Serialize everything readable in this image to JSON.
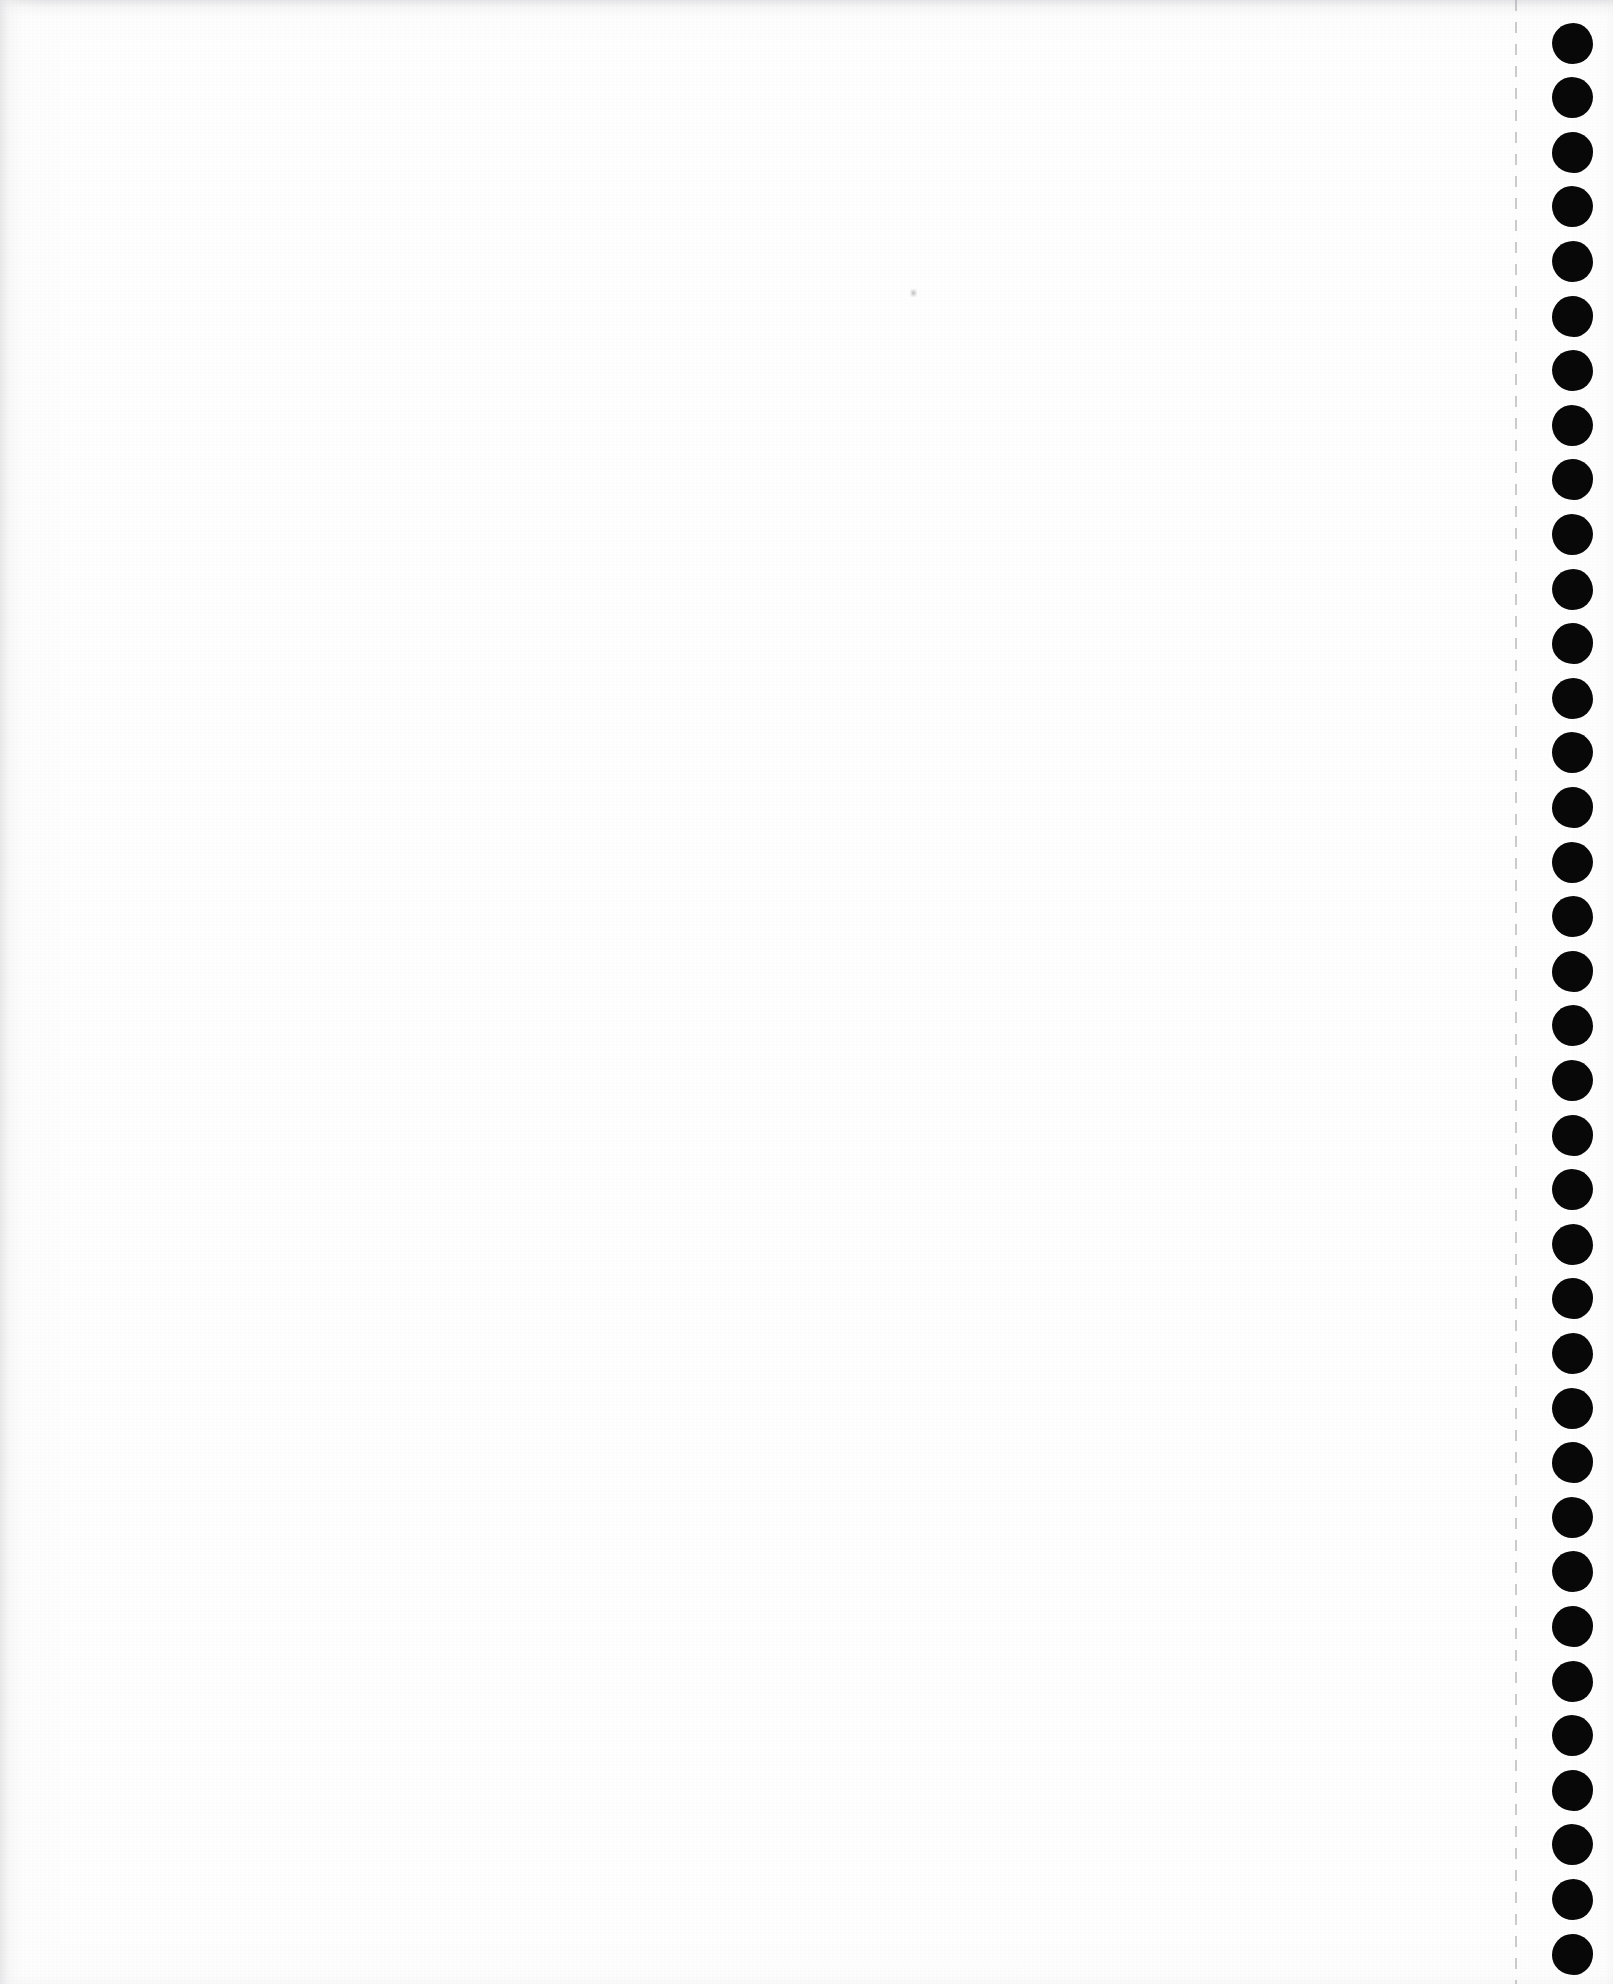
{
  "document": {
    "kind": "scanned-page",
    "media": "continuous-feed tractor paper",
    "page_text": "",
    "orientation": "portrait",
    "page_width_px": 1613,
    "page_height_px": 1984
  },
  "colors": {
    "paper": "#fdfdfd",
    "paper_core": "#fefefe",
    "hole": "#050505",
    "edge_shadow": "#e4e4e6",
    "perforation_line": "#96989c",
    "speck": "#6e6e76"
  },
  "sprocket_strip": {
    "label": "tractor-feed sprocket holes",
    "hole_count": 36,
    "hole_diameter_px": 39,
    "hole_center_x_px": 1572,
    "first_hole_center_y_px": 43,
    "hole_spacing_px": 54.6
  },
  "perforation": {
    "label": "tear-off perforation line",
    "x_px": 1515,
    "dash_length_px": 11,
    "gap_length_px": 11
  },
  "artifacts": {
    "speck": {
      "label": "scanner dust speck",
      "x_px": 910,
      "y_px": 289
    },
    "top_edge_band": {
      "label": "top scan edge shading",
      "height_px": 14
    },
    "left_edge_band": {
      "label": "left scan edge shading",
      "width_px": 18
    }
  }
}
